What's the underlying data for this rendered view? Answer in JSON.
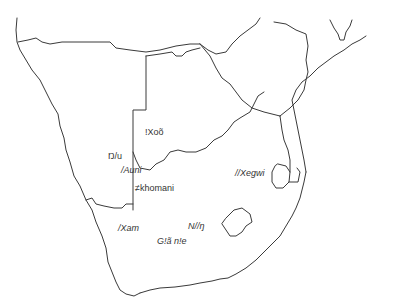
{
  "map": {
    "region": "Southern Africa",
    "line_color": "#3a3a3a",
    "background": "#ffffff",
    "labels": [
      {
        "text": "!Xoõ",
        "x": 145,
        "y": 128,
        "italic": false
      },
      {
        "text": "Ŋ/u",
        "x": 108,
        "y": 152,
        "italic": false
      },
      {
        "text": "/Auni",
        "x": 121,
        "y": 166,
        "italic": true
      },
      {
        "text": "≠khomani",
        "x": 135,
        "y": 184,
        "italic": false
      },
      {
        "text": "//Xegwi",
        "x": 235,
        "y": 169,
        "italic": true
      },
      {
        "text": "/Xam",
        "x": 118,
        "y": 224,
        "italic": true
      },
      {
        "text": "N//ŋ",
        "x": 188,
        "y": 222,
        "italic": true
      },
      {
        "text": "G!ã n!e",
        "x": 157,
        "y": 237,
        "italic": true
      }
    ]
  }
}
